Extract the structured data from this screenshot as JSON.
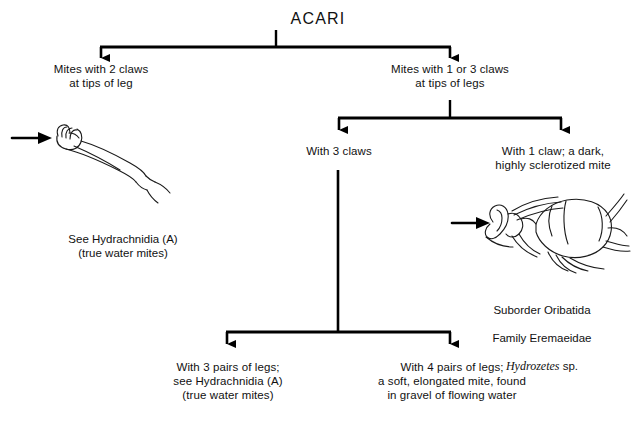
{
  "diagram": {
    "type": "dichotomous-key",
    "root": {
      "label": "ACARI"
    },
    "nodes": {
      "mites_2_claws": "Mites with 2 claws\nat tips of leg",
      "mites_1_or_3_claws": "Mites with 1 or 3 claws\nat tips of legs",
      "with_3_claws": "With 3 claws",
      "with_1_claw": "With 1 claw; a dark,\nhighly sclerotized mite",
      "three_pairs_legs": "With 3 pairs of legs;\nsee Hydrachnidia (A)\n(true water mites)",
      "four_pairs_legs": "With 4 pairs of legs;\na soft, elongated mite, found\nin gravel of flowing water"
    },
    "captions": {
      "left_specimen": "See Hydrachnidia (A)\n(true water mites)",
      "right_specimen_line1": "Suborder Oribatida",
      "right_specimen_line2": "Family Eremaeidae",
      "right_specimen_genus": "Hydrozetes",
      "right_specimen_rank": " sp."
    },
    "illustrations": {
      "left": "mite-leg-tip-with-claws-illustration",
      "right": "oribatid-mite-single-claw-illustration"
    },
    "colors": {
      "line": "#000000",
      "text": "#111111",
      "background": "#ffffff"
    }
  }
}
